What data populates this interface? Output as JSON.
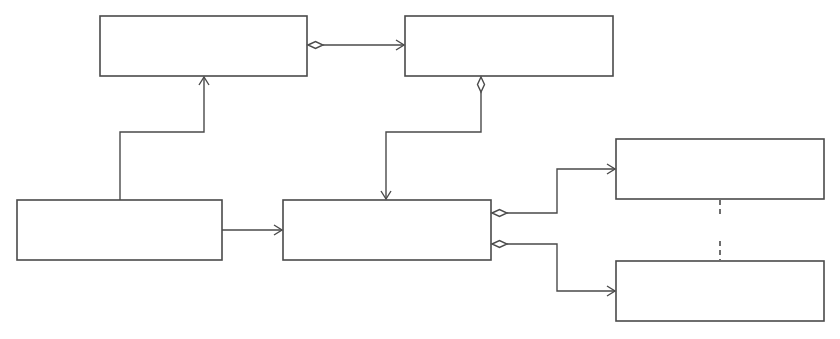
{
  "diagram": {
    "type": "class-diagram",
    "colors": {
      "line": "#4a4a4a",
      "box_fill": "#ffffff",
      "background": "#ffffff"
    },
    "nodes": [
      {
        "id": "top-left",
        "label": ""
      },
      {
        "id": "top-right",
        "label": ""
      },
      {
        "id": "bottom-left",
        "label": ""
      },
      {
        "id": "center",
        "label": ""
      },
      {
        "id": "right-upper",
        "label": ""
      },
      {
        "id": "right-lower",
        "label": ""
      }
    ],
    "edges": [
      {
        "from": "top-left",
        "to": "top-right",
        "kind": "aggregation",
        "source_end": "hollow-diamond",
        "target_end": "open-arrow"
      },
      {
        "from": "top-right",
        "to": "center",
        "kind": "aggregation",
        "source_end": "hollow-diamond",
        "target_end": "open-arrow"
      },
      {
        "from": "bottom-left",
        "to": "top-left",
        "kind": "association",
        "source_end": "none",
        "target_end": "open-arrow"
      },
      {
        "from": "bottom-left",
        "to": "center",
        "kind": "association",
        "source_end": "none",
        "target_end": "open-arrow"
      },
      {
        "from": "center",
        "to": "right-upper",
        "kind": "aggregation",
        "source_end": "hollow-diamond",
        "target_end": "open-arrow"
      },
      {
        "from": "center",
        "to": "right-lower",
        "kind": "aggregation",
        "source_end": "hollow-diamond",
        "target_end": "open-arrow"
      }
    ],
    "ellipsis": {
      "between": [
        "right-upper",
        "right-lower"
      ],
      "style": "dashed"
    }
  }
}
